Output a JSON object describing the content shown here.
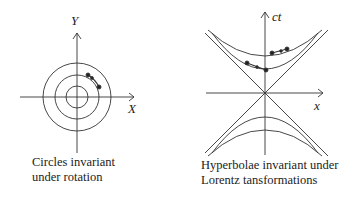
{
  "left": {
    "y_label": "Y",
    "x_label": "X",
    "caption_line1": "Circles invariant",
    "caption_line2": "under rotation"
  },
  "right": {
    "y_label": "ct",
    "x_label": "x",
    "caption_line1": "Hyperbolae invariant under",
    "caption_line2": "Lorentz tansformations"
  },
  "colors": {
    "stroke": "#333333",
    "text": "#222222"
  }
}
